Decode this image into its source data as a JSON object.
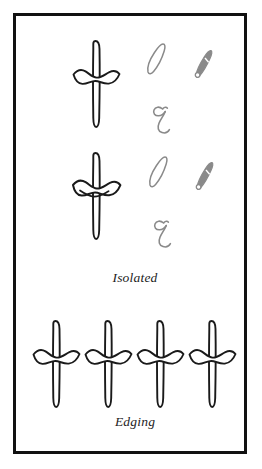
{
  "plate": {
    "background_color": "#ffffff",
    "border_color": "#111111",
    "ink_color": "#1a1a1a",
    "guide_color": "#8a8a8a"
  },
  "sections": [
    {
      "id": "isolated",
      "caption": "Isolated",
      "rows": [
        {
          "id": "isolated-row-1",
          "letter_form_name": "kaf-isolated-form",
          "guides": [
            {
              "name": "pen-stroke-outline-guide"
            },
            {
              "name": "pen-nib-stroke-guide"
            },
            {
              "name": "ayn-stroke-order-guide"
            }
          ]
        },
        {
          "id": "isolated-row-2",
          "letter_form_name": "kaf-isolated-form-variant",
          "guides": [
            {
              "name": "pen-stroke-outline-guide"
            },
            {
              "name": "pen-nib-stroke-guide"
            },
            {
              "name": "ayn-stroke-order-guide"
            }
          ]
        }
      ]
    },
    {
      "id": "edging",
      "caption": "Edging",
      "rows": [
        {
          "id": "edging-row-1",
          "letter_form_name": "kaf-edging-form",
          "repetitions": 4
        }
      ]
    }
  ]
}
